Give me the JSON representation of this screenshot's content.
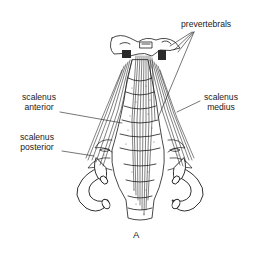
{
  "figure": {
    "caption": "A",
    "colors": {
      "ink": "#1a1a1a",
      "background": "#ffffff",
      "stipple": "#555555"
    }
  },
  "labels": {
    "prevertebrals": "prevertebrals",
    "scalenus_anterior": {
      "line1": "scalenus",
      "line2": "anterior"
    },
    "scalenus_medius": {
      "line1": "scalenus",
      "line2": "medius"
    },
    "scalenus_posterior": {
      "line1": "scalenus",
      "line2": "posterior"
    }
  }
}
